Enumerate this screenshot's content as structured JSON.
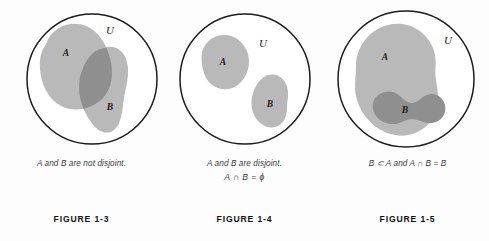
{
  "page": {
    "background_color": "#fdfdfd",
    "figure_count": 3
  },
  "colors": {
    "universe_outline": "#1c1c1c",
    "set_fill_light": "#b9b9b9",
    "set_fill_dark": "#8f8f8f",
    "label_text": "#1a1a1a",
    "caption_text": "#3a3a3a",
    "figure_label_text": "#111111"
  },
  "figures": [
    {
      "id": "figure-1-3",
      "universe_label": "U",
      "set_a_label": "A",
      "set_b_label": "B",
      "caption_line1": "A and B are not disjoint.",
      "caption_line2": "",
      "figure_label": "FIGURE 1-3",
      "relation": "overlapping"
    },
    {
      "id": "figure-1-4",
      "universe_label": "U",
      "set_a_label": "A",
      "set_b_label": "B",
      "caption_line1": "A and B are disjoint.",
      "caption_line2": "A ∩ B = ϕ",
      "figure_label": "FIGURE 1-4",
      "relation": "disjoint"
    },
    {
      "id": "figure-1-5",
      "universe_label": "U",
      "set_a_label": "A",
      "set_b_label": "B",
      "caption_line1": "B ⊂ A and A ∩ B = B",
      "caption_line2": "",
      "figure_label": "FIGURE 1-5",
      "relation": "subset"
    }
  ]
}
